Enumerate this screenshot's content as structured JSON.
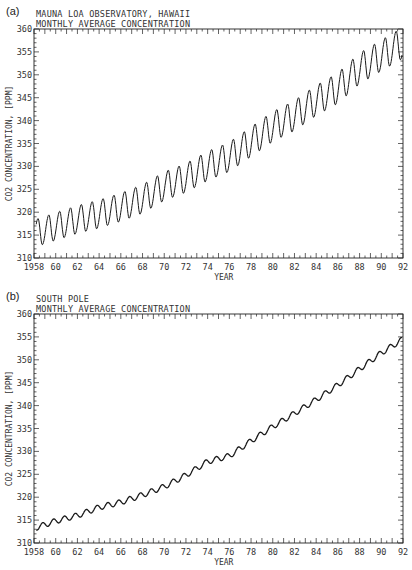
{
  "panels": [
    {
      "label": "(a)",
      "title": "MAUNA LOA OBSERVATORY, HAWAII",
      "subtitle": "MONTHLY AVERAGE CONCENTRATION",
      "ylabel": "CO2 CONCENTRATION, [PPM]",
      "xlabel": "YEAR"
    },
    {
      "label": "(b)",
      "title": "SOUTH POLE",
      "subtitle": "MONTHLY AVERAGE CONCENTRATION",
      "ylabel": "CO2 CONCENTRATION, [PPM]",
      "xlabel": "YEAR"
    }
  ],
  "axes": {
    "x_ticks": [
      "1958",
      "60",
      "62",
      "64",
      "66",
      "68",
      "70",
      "72",
      "74",
      "76",
      "78",
      "80",
      "82",
      "84",
      "86",
      "88",
      "90",
      "92"
    ],
    "y_ticks": [
      "310",
      "315",
      "320",
      "325",
      "330",
      "335",
      "340",
      "345",
      "350",
      "355",
      "360"
    ]
  },
  "chart_data": [
    {
      "type": "line",
      "title": "MAUNA LOA OBSERVATORY, HAWAII",
      "subtitle": "MONTHLY AVERAGE CONCENTRATION",
      "panel_label": "(a)",
      "xlabel": "YEAR",
      "ylabel": "CO2 CONCENTRATION, [PPM]",
      "xlim": [
        1958,
        1992
      ],
      "ylim": [
        310,
        360
      ],
      "x_ticks": [
        1958,
        1960,
        1962,
        1964,
        1966,
        1968,
        1970,
        1972,
        1974,
        1976,
        1978,
        1980,
        1982,
        1984,
        1986,
        1988,
        1990,
        1992
      ],
      "y_ticks": [
        310,
        315,
        320,
        325,
        330,
        335,
        340,
        345,
        350,
        355,
        360
      ],
      "grid": false,
      "legend": null,
      "series": [
        {
          "name": "Mauna Loa monthly CO2",
          "seasonal_amplitude_ppm": 6,
          "annual_mean": {
            "x": [
              1958,
              1960,
              1962,
              1964,
              1966,
              1968,
              1970,
              1972,
              1974,
              1976,
              1978,
              1980,
              1982,
              1984,
              1986,
              1988,
              1990,
              1991
            ],
            "y": [
              315.3,
              316.9,
              318.4,
              319.6,
              321.1,
              322.9,
              325.7,
              327.5,
              330.1,
              332.1,
              335.4,
              338.7,
              341.1,
              344.4,
              347.1,
              351.4,
              354.2,
              355.6
            ]
          },
          "seasonal_peaks": {
            "month": "May",
            "approx_1959": 318,
            "approx_1991": 359
          },
          "seasonal_troughs": {
            "month": "Sep/Oct",
            "approx_1959": 313,
            "approx_1991": 352
          }
        }
      ]
    },
    {
      "type": "line",
      "title": "SOUTH POLE",
      "subtitle": "MONTHLY AVERAGE CONCENTRATION",
      "panel_label": "(b)",
      "xlabel": "YEAR",
      "ylabel": "CO2 CONCENTRATION, [PPM]",
      "xlim": [
        1958,
        1992
      ],
      "ylim": [
        310,
        360
      ],
      "x_ticks": [
        1958,
        1960,
        1962,
        1964,
        1966,
        1968,
        1970,
        1972,
        1974,
        1976,
        1978,
        1980,
        1982,
        1984,
        1986,
        1988,
        1990,
        1992
      ],
      "y_ticks": [
        310,
        315,
        320,
        325,
        330,
        335,
        340,
        345,
        350,
        355,
        360
      ],
      "grid": false,
      "legend": null,
      "series": [
        {
          "name": "South Pole monthly CO2",
          "seasonal_amplitude_ppm": 1.2,
          "annual_mean": {
            "x": [
              1958,
              1960,
              1962,
              1964,
              1966,
              1968,
              1970,
              1972,
              1974,
              1976,
              1978,
              1980,
              1982,
              1984,
              1986,
              1988,
              1990,
              1991
            ],
            "y": [
              313.2,
              314.8,
              316.0,
              317.8,
              318.9,
              320.5,
              322.3,
              324.8,
              327.8,
              329.0,
              332.3,
              335.4,
              338.3,
              341.3,
              344.5,
              348.0,
              351.5,
              353.0
            ]
          }
        }
      ]
    }
  ]
}
